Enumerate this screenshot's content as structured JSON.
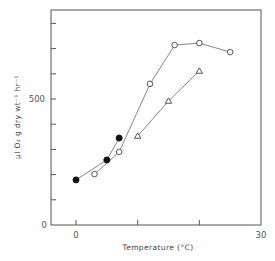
{
  "chart_data": {
    "type": "line",
    "title": "",
    "xlabel": "Temperature (°C)",
    "ylabel": "μl O₂ g dry wt⁻¹ hr⁻¹",
    "xlim": [
      -5,
      30
    ],
    "ylim": [
      0,
      853
    ],
    "x_ticks": [
      0,
      10,
      20,
      30
    ],
    "x_tick_labels": [
      "0",
      "",
      "",
      "30"
    ],
    "y_ticks": [
      0,
      100,
      200,
      300,
      400,
      500,
      600,
      700,
      800
    ],
    "y_tick_labels": [
      "0",
      "",
      "",
      "",
      "",
      "500",
      "",
      "",
      ""
    ],
    "grid": false,
    "legend": null,
    "series": [
      {
        "name": "filled-circles",
        "marker": "filled-circle",
        "points": [
          [
            0,
            179
          ],
          [
            5,
            258
          ],
          [
            7,
            345
          ]
        ]
      },
      {
        "name": "open-circles",
        "marker": "open-circle",
        "points": [
          [
            3,
            202
          ],
          [
            7,
            290
          ],
          [
            12,
            560
          ],
          [
            16,
            714
          ],
          [
            20,
            722
          ],
          [
            25,
            686
          ]
        ]
      },
      {
        "name": "open-triangles",
        "marker": "open-triangle",
        "points": [
          [
            10,
            353
          ],
          [
            15,
            492
          ],
          [
            20,
            611
          ]
        ]
      }
    ]
  },
  "labels": {
    "x_axis_title": "Temperature (°C)",
    "y_axis_title": "μl O₂ g dry wt⁻¹ hr⁻¹",
    "y_tick_0": "0",
    "y_tick_500": "500",
    "x_tick_0": "0",
    "x_tick_30": "30"
  }
}
